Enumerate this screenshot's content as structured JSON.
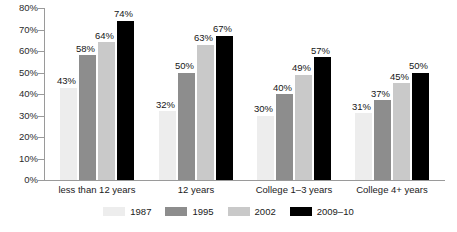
{
  "chart_data": {
    "type": "bar",
    "title": "",
    "subtitle": "",
    "xlabel": "",
    "ylabel": "",
    "ylim": [
      0,
      80
    ],
    "y_tick_labels": [
      "0%",
      "10%",
      "20%",
      "30%",
      "40%",
      "50%",
      "60%",
      "70%",
      "80%"
    ],
    "y_tick_values": [
      0,
      10,
      20,
      30,
      40,
      50,
      60,
      70,
      80
    ],
    "grid": false,
    "legend_position": "bottom",
    "value_suffix": "%",
    "categories": [
      "less than 12 years",
      "12 years",
      "College 1–3 years",
      "College 4+ years"
    ],
    "series": [
      {
        "name": "1987",
        "color": "#ededed",
        "values": [
          43,
          32,
          30,
          31
        ],
        "labels": [
          "43%",
          "32%",
          "30%",
          "31%"
        ]
      },
      {
        "name": "1995",
        "color": "#8d8d8d",
        "values": [
          58,
          50,
          40,
          37
        ],
        "labels": [
          "58%",
          "50%",
          "40%",
          "37%"
        ]
      },
      {
        "name": "2002",
        "color": "#c9c9c9",
        "values": [
          64,
          63,
          49,
          45
        ],
        "labels": [
          "64%",
          "63%",
          "49%",
          "45%"
        ]
      },
      {
        "name": "2009–10",
        "color": "#000000",
        "values": [
          74,
          67,
          57,
          50
        ],
        "labels": [
          "74%",
          "67%",
          "57%",
          "50%"
        ]
      }
    ]
  },
  "legend": {
    "items": [
      {
        "label": "1987",
        "color": "#ededed"
      },
      {
        "label": "1995",
        "color": "#8d8d8d"
      },
      {
        "label": "2002",
        "color": "#c9c9c9"
      },
      {
        "label": "2009–10",
        "color": "#000000"
      }
    ]
  },
  "axis": {
    "line_color": "#9a9a9a"
  }
}
